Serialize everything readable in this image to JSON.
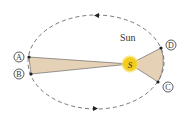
{
  "diagram": {
    "type": "kepler-second-law",
    "sun_label": "Sun",
    "sun_symbol": "S",
    "points": [
      {
        "id": "A",
        "label": "A"
      },
      {
        "id": "B",
        "label": "B"
      },
      {
        "id": "C",
        "label": "C"
      },
      {
        "id": "D",
        "label": "D"
      }
    ],
    "colors": {
      "orbit": "#555555",
      "sector_fill": "#e4d1b6",
      "sector_stroke": "#555555",
      "sun": "#f4cc1c",
      "sun_glow": "#fbe98a",
      "point": "#222222"
    },
    "orbit_direction": "counterclockwise"
  }
}
